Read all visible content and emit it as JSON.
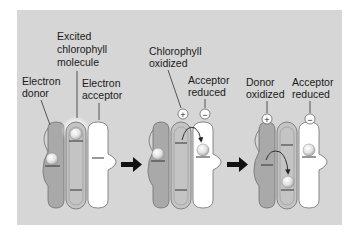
{
  "colors": {
    "panel_bg": "#d6d6d6",
    "donor_fill": "#a9a9a9",
    "chlorophyll_fill": "#c4c4c4",
    "acceptor_fill": "#ffffff",
    "outline": "#6f6f6f",
    "electron_fill": "#e9e9e9",
    "arrow": "#111111"
  },
  "labels": {
    "stage1": {
      "excited_chlorophyll": [
        "Excited",
        "chlorophyll",
        "molecule"
      ],
      "electron_donor": [
        "Electron",
        "donor"
      ],
      "electron_acceptor": [
        "Electron",
        "acceptor"
      ]
    },
    "stage2": {
      "chlorophyll_oxidized": [
        "Chlorophyll",
        "oxidized"
      ],
      "acceptor_reduced": [
        "Acceptor",
        "reduced"
      ]
    },
    "stage3": {
      "donor_oxidized": [
        "Donor",
        "oxidized"
      ],
      "acceptor_reduced": [
        "Acceptor",
        "reduced"
      ]
    }
  },
  "charges": {
    "plus": "+",
    "minus": "−"
  },
  "stages": [
    {
      "id": 1,
      "description": "Excited chlorophyll next to donor and acceptor"
    },
    {
      "id": 2,
      "description": "Electron transferred from chlorophyll to acceptor"
    },
    {
      "id": 3,
      "description": "Electron transferred from donor to chlorophyll"
    }
  ]
}
